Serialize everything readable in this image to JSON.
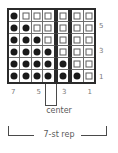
{
  "chart_data": {
    "type": "heatmap",
    "title": "",
    "columns": 7,
    "rows": 6,
    "symbol_legend": {
      "filled": "dot-symbol",
      "empty": "open-box-symbol"
    },
    "cells": [
      [
        "dot",
        "box",
        "box",
        "box",
        "box",
        "box",
        "box"
      ],
      [
        "dot",
        "dot",
        "box",
        "box",
        "box",
        "box",
        "box"
      ],
      [
        "dot",
        "dot",
        "dot",
        "box",
        "box",
        "box",
        "box"
      ],
      [
        "dot",
        "dot",
        "dot",
        "dot",
        "box",
        "box",
        "box"
      ],
      [
        "dot",
        "dot",
        "dot",
        "dot",
        "dot",
        "box",
        "box"
      ],
      [
        "dot",
        "dot",
        "dot",
        "dot",
        "dot",
        "dot",
        "box"
      ]
    ],
    "row_labels": [
      "",
      "5",
      "",
      "3",
      "",
      "1"
    ],
    "row_label_values": [
      5,
      3,
      1
    ],
    "column_labels": [
      "7",
      "",
      "5",
      "",
      "3",
      "",
      "1"
    ],
    "column_label_values": [
      7,
      5,
      3,
      1
    ],
    "repeat_divider_after_columns": [
      3,
      4
    ],
    "grid": true,
    "legend_position": "none"
  },
  "annotations": {
    "center_label": "center",
    "repeat_label": "7-st rep"
  },
  "colors": {
    "grid_outline": "#2b2b2b",
    "grid_line": "#6e6e6e",
    "filled_symbol": "#1a1a1a",
    "empty_symbol_border": "#5d5d5d",
    "label_text": "#7a7a7a",
    "annotation_text": "#5a5a5a",
    "background": "#ffffff"
  }
}
